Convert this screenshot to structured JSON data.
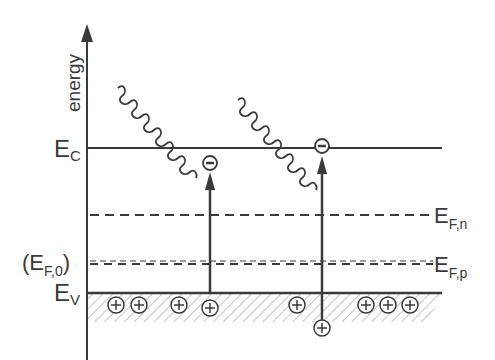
{
  "diagram": {
    "axis_label": "energy",
    "levels": {
      "conduction_band": {
        "main": "E",
        "sub": "C"
      },
      "valence_band": {
        "main": "E",
        "sub": "V"
      },
      "fermi_n": {
        "main": "E",
        "sub": "F,n"
      },
      "fermi_p": {
        "main": "E",
        "sub": "F,p"
      },
      "fermi_equilibrium": {
        "open": "(",
        "main": "E",
        "sub": "F,0",
        "close": ")"
      }
    },
    "carriers": {
      "electron_symbol": "−",
      "hole_symbol": "+"
    },
    "colors": {
      "ink": "#3a3a3a",
      "hatch": "#8a8a8a",
      "background": "#ffffff"
    }
  }
}
